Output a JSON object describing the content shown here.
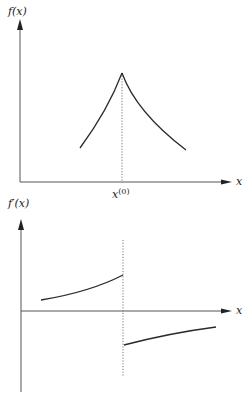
{
  "figure": {
    "colors": {
      "line": "#2a2a2a",
      "axis": "#555555",
      "dotted": "#777777",
      "background": "#ffffff"
    },
    "top_plot": {
      "y_label": "f(x)",
      "x_label": "x",
      "marker_label": "x",
      "marker_superscript": "(0)",
      "description": "Function f(x) with a cusp (kink) maximum at x(0)"
    },
    "bottom_plot": {
      "y_label": "f′(x)",
      "x_label": "x",
      "description": "Derivative f'(x) positive left of x(0), jumps discontinuously to negative right of x(0)"
    }
  }
}
